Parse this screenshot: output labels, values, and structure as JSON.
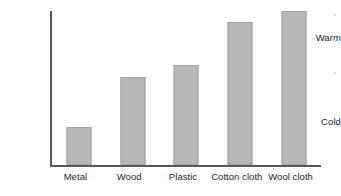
{
  "chart_data": {
    "type": "bar",
    "title": "",
    "subtitle": "",
    "xlabel": "",
    "ylabel": "",
    "categories": [
      "Metal",
      "Wood",
      "Plastic",
      "Cotton cloth",
      "Wool cloth"
    ],
    "values": [
      24,
      56,
      64,
      91,
      98
    ],
    "ytick_labels": [
      "Warm",
      "Cold"
    ],
    "ylim": [
      0,
      100
    ],
    "grid": false,
    "legend": "none",
    "series": [
      {
        "name": "Temperature felt",
        "values": [
          24,
          56,
          64,
          91,
          98
        ]
      }
    ],
    "annotations": [],
    "colors": {
      "bar_fill": "#b8b8b8",
      "bar_stroke": "#a2a2a2",
      "axis": "#5a5a5a",
      "text": "#1c1c1c",
      "background": "#ffffff"
    }
  }
}
